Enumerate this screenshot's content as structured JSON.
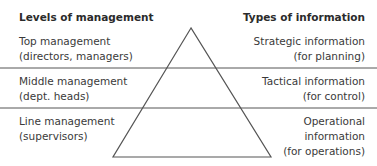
{
  "headers": {
    "left": "Levels of management",
    "right": "Types of information"
  },
  "levels": [
    {
      "line1": "Top management",
      "line2": "(directors, managers)"
    },
    {
      "line1": "Middle management",
      "line2": "(dept. heads)"
    },
    {
      "line1": "Line management",
      "line2": "(supervisors)"
    }
  ],
  "info": [
    {
      "line1": "Strategic information",
      "line2": "(for planning)"
    },
    {
      "line1": "Tactical information",
      "line2": "(for control)"
    },
    {
      "line1": "Operational",
      "line2": "information",
      "line3": "(for operations)"
    }
  ],
  "colors": {
    "line": "#555555",
    "text": "#3a3a3a"
  }
}
